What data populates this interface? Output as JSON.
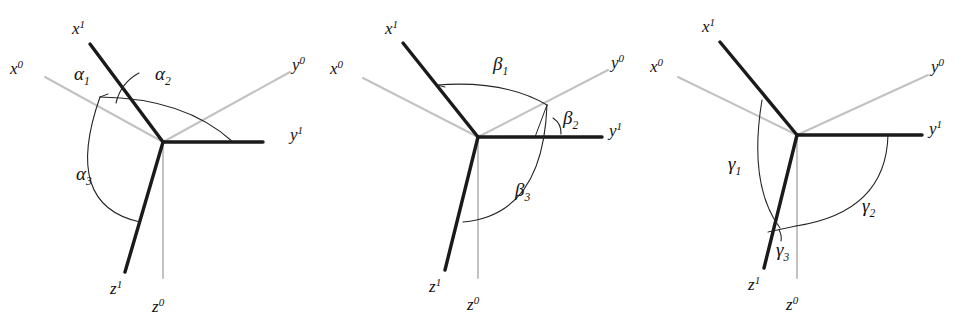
{
  "figure": {
    "background_color": "#ffffff",
    "new_axis_color": "#1a1a1a",
    "old_axis_color": "#c2c2c2",
    "arc_color": "#242424",
    "panel_count": 3
  },
  "panels": [
    {
      "id": "alpha",
      "name": "alpha-panel",
      "axis_labels": {
        "x_new": {
          "base": "x",
          "sup": "1"
        },
        "x_old": {
          "base": "x",
          "sup": "0"
        },
        "y_new": {
          "base": "y",
          "sup": "1"
        },
        "y_old": {
          "base": "y",
          "sup": "0"
        },
        "z_new": {
          "base": "z",
          "sup": "1"
        },
        "z_old": {
          "base": "z",
          "sup": "0"
        }
      },
      "angle_labels": [
        {
          "base": "α",
          "sub": "1",
          "name": "alpha-1-label"
        },
        {
          "base": "α",
          "sub": "2",
          "name": "alpha-2-label"
        },
        {
          "base": "α",
          "sub": "3",
          "name": "alpha-3-label"
        }
      ]
    },
    {
      "id": "beta",
      "name": "beta-panel",
      "axis_labels": {
        "x_new": {
          "base": "x",
          "sup": "1"
        },
        "x_old": {
          "base": "x",
          "sup": "0"
        },
        "y_new": {
          "base": "y",
          "sup": "1"
        },
        "y_old": {
          "base": "y",
          "sup": "0"
        },
        "z_new": {
          "base": "z",
          "sup": "1"
        },
        "z_old": {
          "base": "z",
          "sup": "0"
        }
      },
      "angle_labels": [
        {
          "base": "β",
          "sub": "1",
          "name": "beta-1-label"
        },
        {
          "base": "β",
          "sub": "2",
          "name": "beta-2-label"
        },
        {
          "base": "β",
          "sub": "3",
          "name": "beta-3-label"
        }
      ]
    },
    {
      "id": "gamma",
      "name": "gamma-panel",
      "axis_labels": {
        "x_new": {
          "base": "x",
          "sup": "1"
        },
        "x_old": {
          "base": "x",
          "sup": "0"
        },
        "y_new": {
          "base": "y",
          "sup": "1"
        },
        "y_old": {
          "base": "y",
          "sup": "0"
        },
        "z_new": {
          "base": "z",
          "sup": "1"
        },
        "z_old": {
          "base": "z",
          "sup": "0"
        }
      },
      "angle_labels": [
        {
          "base": "γ",
          "sub": "1",
          "name": "gamma-1-label"
        },
        {
          "base": "γ",
          "sub": "2",
          "name": "gamma-2-label"
        },
        {
          "base": "γ",
          "sub": "3",
          "name": "gamma-3-label"
        }
      ]
    }
  ]
}
